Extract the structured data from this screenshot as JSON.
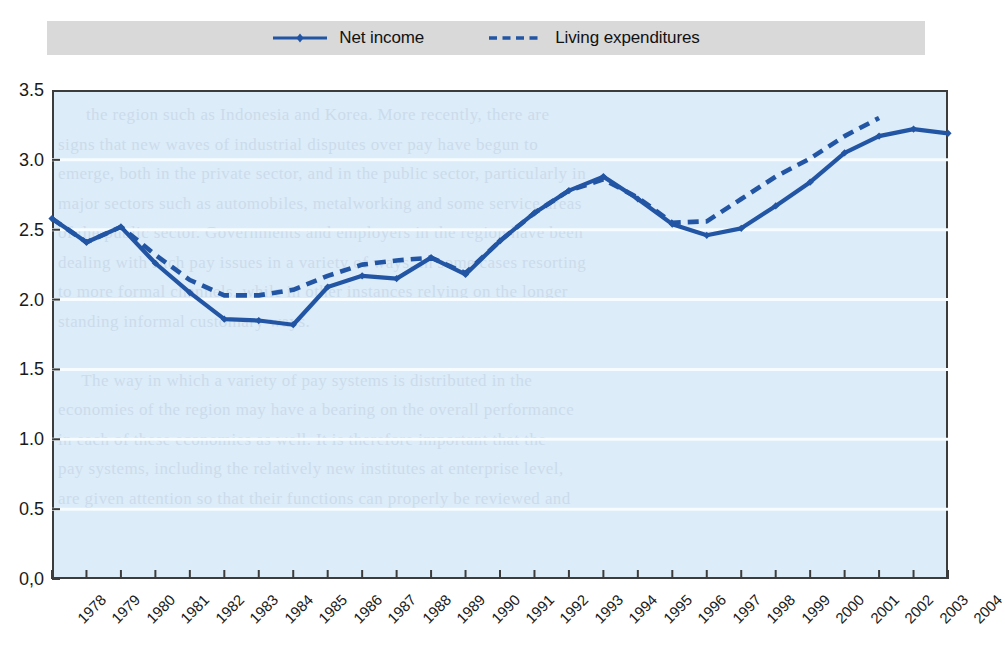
{
  "legend": {
    "position": "top",
    "entries": [
      {
        "label": "Net income",
        "style": "solid-with-marker",
        "color": "#2255a4"
      },
      {
        "label": "Living expenditures",
        "style": "dashed",
        "color": "#2255a4"
      }
    ]
  },
  "colors": {
    "series": "#2255a4",
    "plot_background": "#dcecf8",
    "legend_band": "#d9d9d9",
    "frame": "#3c3c3c",
    "gridline": "#f4fbff"
  },
  "chart_data": {
    "type": "line",
    "title": "",
    "xlabel": "",
    "ylabel": "",
    "ylim": [
      0.0,
      3.5
    ],
    "ytick_labels": [
      "3.5",
      "3.0",
      "2.5",
      "2.0",
      "1.5",
      "1.0",
      "0.5",
      "0,0"
    ],
    "ytick_values": [
      3.5,
      3.0,
      2.5,
      2.0,
      1.5,
      1.0,
      0.5,
      0.0
    ],
    "grid": true,
    "legend_position": "top",
    "categories": [
      "1978",
      "1979",
      "1980",
      "1981",
      "1982",
      "1983",
      "1984",
      "1985",
      "1986",
      "1987",
      "1988",
      "1989",
      "1990",
      "1991",
      "1992",
      "1993",
      "1994",
      "1995",
      "1996",
      "1997",
      "1998",
      "1999",
      "2000",
      "2001",
      "2002",
      "2003",
      "2004"
    ],
    "series": [
      {
        "name": "Net income",
        "style": "solid",
        "marker": "diamond",
        "values": [
          2.58,
          2.41,
          2.52,
          2.26,
          2.05,
          1.86,
          1.85,
          1.82,
          2.09,
          2.17,
          2.15,
          2.3,
          2.18,
          2.42,
          2.62,
          2.78,
          2.88,
          2.72,
          2.54,
          2.46,
          2.51,
          2.67,
          2.84,
          3.05,
          3.17,
          3.22,
          3.19
        ]
      },
      {
        "name": "Living expenditures",
        "style": "dashed",
        "marker": "none",
        "values": [
          2.58,
          2.41,
          2.52,
          2.32,
          2.14,
          2.03,
          2.03,
          2.07,
          2.17,
          2.25,
          2.28,
          2.3,
          2.19,
          2.42,
          2.62,
          2.78,
          2.86,
          2.73,
          2.55,
          2.56,
          2.72,
          2.88,
          3.01,
          3.17,
          3.3,
          null,
          null
        ]
      }
    ]
  }
}
